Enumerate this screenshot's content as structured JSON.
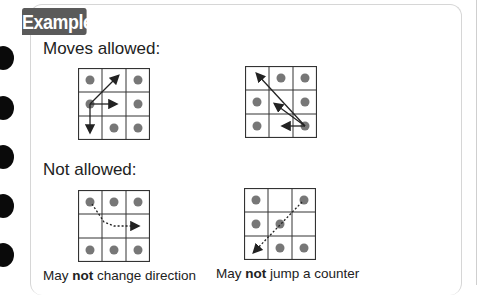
{
  "tab_label": "Example",
  "sections": {
    "allowed": {
      "heading": "Moves allowed:"
    },
    "not_allowed": {
      "heading": "Not allowed:",
      "captions": [
        {
          "prefix": "May ",
          "bold": "not",
          "suffix": " change direction"
        },
        {
          "prefix": "May ",
          "bold": "not",
          "suffix": " jump a counter"
        }
      ]
    }
  },
  "colors": {
    "tab_bg": "#5a5a5a",
    "counter": "#777777",
    "grid_line": "#333333"
  },
  "diagrams": [
    {
      "name": "allowed-1",
      "counters": [
        [
          0,
          0
        ],
        [
          0,
          2
        ],
        [
          1,
          0
        ],
        [
          1,
          2
        ],
        [
          2,
          1
        ],
        [
          2,
          2
        ]
      ],
      "arrows": "diag-up-right, right, down from middle-left",
      "style": "solid"
    },
    {
      "name": "allowed-2",
      "counters": [
        [
          0,
          1
        ],
        [
          0,
          2
        ],
        [
          1,
          0
        ],
        [
          1,
          2
        ],
        [
          2,
          0
        ],
        [
          2,
          2
        ]
      ],
      "arrows": "from bottom-right: to top-left, to middle, left",
      "style": "solid"
    },
    {
      "name": "not-allowed-1",
      "counters": [
        [
          0,
          0
        ],
        [
          0,
          1
        ],
        [
          0,
          2
        ],
        [
          2,
          0
        ],
        [
          2,
          1
        ],
        [
          2,
          2
        ]
      ],
      "arrows": "diagonal then right",
      "style": "dotted"
    },
    {
      "name": "not-allowed-2",
      "counters": [
        [
          0,
          0
        ],
        [
          0,
          2
        ],
        [
          1,
          0
        ],
        [
          1,
          1
        ],
        [
          2,
          1
        ],
        [
          2,
          2
        ]
      ],
      "arrows": "top-right to bottom-left over counter",
      "style": "dotted"
    }
  ]
}
